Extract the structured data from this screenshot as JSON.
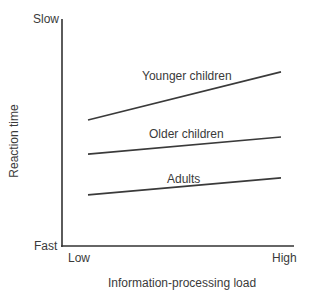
{
  "chart_data": {
    "type": "line",
    "title": "",
    "xlabel": "Information-processing load",
    "ylabel": "Reaction time",
    "x": [
      "Low",
      "High"
    ],
    "x_tick_labels": [
      "Low",
      "High"
    ],
    "y_tick_labels": [
      "Fast",
      "Slow"
    ],
    "ylim": [
      0,
      100
    ],
    "grid": false,
    "legend_position": "inline labels above each line",
    "series": [
      {
        "name": "Younger children",
        "values": [
          55.5,
          76.7
        ]
      },
      {
        "name": "Older children",
        "values": [
          40.5,
          48.0
        ]
      },
      {
        "name": "Adults",
        "values": [
          22.5,
          30.0
        ]
      }
    ],
    "line_color": "#3a3a3a"
  },
  "labels": {
    "y_top": "Slow",
    "y_bottom": "Fast",
    "x_left": "Low",
    "x_right": "High",
    "xlabel": "Information-processing load",
    "ylabel": "Reaction time",
    "series": [
      "Younger children",
      "Older children",
      "Adults"
    ]
  }
}
